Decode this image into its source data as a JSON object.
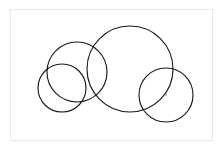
{
  "figure": {
    "title": "Overlapping circles diagram",
    "canvas": {
      "width": 222,
      "height": 149,
      "background_color": "#ffffff"
    },
    "frame": {
      "name": "figure-border",
      "x": 10,
      "y": 9,
      "width": 202,
      "height": 131,
      "stroke_color": "#e8e8e8",
      "fill_color": "#ffffff",
      "stroke_width": 1
    },
    "stroke_color": "#1a1a1a",
    "stroke_width": 1.15,
    "circle_count": "4",
    "marker_count": "1"
  },
  "chart_data": {
    "type": "scatter",
    "title": "Overlapping circles diagram",
    "xlabel": "",
    "ylabel": "",
    "xlim": [
      0,
      222
    ],
    "ylim": [
      0,
      149
    ],
    "grid": false,
    "legend": "none",
    "shapes": [
      {
        "id": "circle-1",
        "label": "left circle",
        "cx": 62,
        "cy": 88,
        "r": 24,
        "stroke": "#1a1a1a",
        "fill": "none"
      },
      {
        "id": "circle-2",
        "label": "upper left-middle circle",
        "cx": 77,
        "cy": 72,
        "r": 30,
        "stroke": "#1a1a1a",
        "fill": "none"
      },
      {
        "id": "circle-3",
        "label": "large center circle",
        "cx": 130,
        "cy": 69,
        "r": 43,
        "stroke": "#1a1a1a",
        "fill": "none"
      },
      {
        "id": "circle-4",
        "label": "right circle",
        "cx": 166,
        "cy": 95,
        "r": 27,
        "stroke": "#1a1a1a",
        "fill": "none"
      }
    ],
    "markers": [
      {
        "id": "marker-1",
        "label": "center point of right circle",
        "cx": 166,
        "cy": 95,
        "r": 1,
        "color": "#b0b0b0"
      }
    ]
  }
}
